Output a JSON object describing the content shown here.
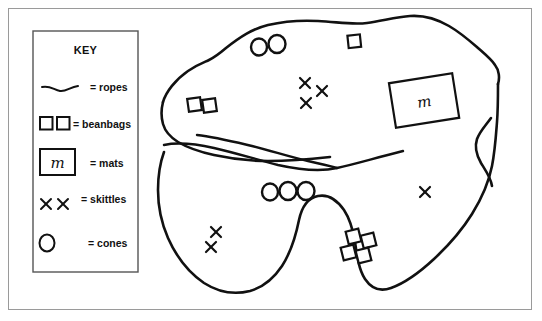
{
  "figure": {
    "background_color": "#ffffff",
    "ink_color": "#111111",
    "frame_color": "#9a9a9a"
  },
  "key": {
    "heading": "KEY",
    "entries": [
      {
        "symbol": "wavy-line",
        "label": "= ropes",
        "name": "ropes"
      },
      {
        "symbol": "two-small-squares",
        "label": "= beanbags",
        "name": "beanbags"
      },
      {
        "symbol": "rectangle-with-m",
        "label": "= mats",
        "name": "mats",
        "letter": "m"
      },
      {
        "symbol": "two-crosses",
        "label": "= skittles",
        "name": "skittles"
      },
      {
        "symbol": "circle",
        "label": "= cones",
        "name": "cones"
      }
    ]
  },
  "map": {
    "mat": {
      "letter": "m",
      "x": 424,
      "y": 100
    },
    "cones": [
      {
        "x": 259,
        "y": 47
      },
      {
        "x": 276,
        "y": 45
      },
      {
        "x": 270,
        "y": 192
      },
      {
        "x": 286,
        "y": 192
      },
      {
        "x": 302,
        "y": 192
      }
    ],
    "beanbags": [
      {
        "x": 194,
        "y": 104
      },
      {
        "x": 209,
        "y": 105
      },
      {
        "x": 354,
        "y": 41
      },
      {
        "x": 353,
        "y": 236
      },
      {
        "x": 368,
        "y": 240
      },
      {
        "x": 348,
        "y": 252
      },
      {
        "x": 363,
        "y": 256
      }
    ],
    "skittles": [
      {
        "x": 305,
        "y": 83
      },
      {
        "x": 322,
        "y": 91
      },
      {
        "x": 306,
        "y": 103
      },
      {
        "x": 216,
        "y": 232
      },
      {
        "x": 211,
        "y": 247
      },
      {
        "x": 425,
        "y": 192
      }
    ],
    "counts": {
      "cones": 5,
      "beanbags": 7,
      "skittles": 6,
      "mats": 1,
      "ropes": 3
    }
  }
}
